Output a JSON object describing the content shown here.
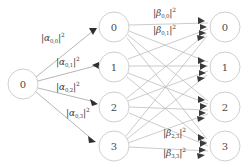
{
  "diagram": {
    "type": "neural-network-graph",
    "title": "",
    "background_color": "#ffffff",
    "edge_color": "#b9b9b9",
    "node_stroke_color": "#c9c9c9",
    "node_text_color": "#4a4a4a",
    "arrow_color": "#2e2e2e"
  },
  "layers": [
    {
      "name": "input-layer",
      "nodes": [
        {
          "label": "0",
          "cx": 23,
          "cy": 84,
          "r": 15
        }
      ]
    },
    {
      "name": "hidden-layer",
      "nodes": [
        {
          "label": "0",
          "cx": 114,
          "cy": 27,
          "r": 15
        },
        {
          "label": "1",
          "cx": 114,
          "cy": 67,
          "r": 15
        },
        {
          "label": "2",
          "cx": 114,
          "cy": 107,
          "r": 15
        },
        {
          "label": "3",
          "cx": 114,
          "cy": 146,
          "r": 15
        }
      ]
    },
    {
      "name": "output-layer",
      "nodes": [
        {
          "label": "0",
          "cx": 225,
          "cy": 27,
          "r": 15
        },
        {
          "label": "1",
          "cx": 225,
          "cy": 67,
          "r": 15
        },
        {
          "label": "2",
          "cx": 225,
          "cy": 107,
          "r": 15
        },
        {
          "label": "3",
          "cx": 225,
          "cy": 146,
          "r": 15
        }
      ]
    }
  ],
  "edge_labels": {
    "alpha": [
      {
        "id": "alpha-0-0",
        "symbol": "α",
        "subscript": "0,0",
        "exponent": "2",
        "x": 41,
        "y": 33
      },
      {
        "id": "alpha-0-1",
        "symbol": "α",
        "subscript": "0,1",
        "exponent": "2",
        "x": 56,
        "y": 57
      },
      {
        "id": "alpha-0-2",
        "symbol": "α",
        "subscript": "0,2",
        "exponent": "2",
        "x": 56,
        "y": 82
      },
      {
        "id": "alpha-0-3",
        "symbol": "α",
        "subscript": "0,3",
        "exponent": "2",
        "x": 66,
        "y": 108
      }
    ],
    "beta": [
      {
        "id": "beta-0-0",
        "symbol": "β",
        "subscript": "0,0",
        "exponent": "2",
        "x": 153,
        "y": 8
      },
      {
        "id": "beta-0-1",
        "symbol": "β",
        "subscript": "0,1",
        "exponent": "2",
        "x": 153,
        "y": 25
      },
      {
        "id": "beta-2-3",
        "symbol": "β",
        "subscript": "2,3",
        "exponent": "2",
        "x": 163,
        "y": 128
      },
      {
        "id": "beta-3-3",
        "symbol": "β",
        "subscript": "3,3",
        "exponent": "2",
        "x": 163,
        "y": 148
      }
    ]
  },
  "connections": {
    "input_to_hidden": [
      {
        "from": "input-0",
        "to": "hidden-0"
      },
      {
        "from": "input-0",
        "to": "hidden-1"
      },
      {
        "from": "input-0",
        "to": "hidden-2"
      },
      {
        "from": "input-0",
        "to": "hidden-3"
      }
    ],
    "hidden_to_output": [
      {
        "from": "hidden-0",
        "to": "output-0"
      },
      {
        "from": "hidden-0",
        "to": "output-1"
      },
      {
        "from": "hidden-0",
        "to": "output-2"
      },
      {
        "from": "hidden-0",
        "to": "output-3"
      },
      {
        "from": "hidden-1",
        "to": "output-0"
      },
      {
        "from": "hidden-1",
        "to": "output-1"
      },
      {
        "from": "hidden-1",
        "to": "output-2"
      },
      {
        "from": "hidden-1",
        "to": "output-3"
      },
      {
        "from": "hidden-2",
        "to": "output-0"
      },
      {
        "from": "hidden-2",
        "to": "output-1"
      },
      {
        "from": "hidden-2",
        "to": "output-2"
      },
      {
        "from": "hidden-2",
        "to": "output-3"
      },
      {
        "from": "hidden-3",
        "to": "output-0"
      },
      {
        "from": "hidden-3",
        "to": "output-1"
      },
      {
        "from": "hidden-3",
        "to": "output-2"
      },
      {
        "from": "hidden-3",
        "to": "output-3"
      }
    ]
  }
}
